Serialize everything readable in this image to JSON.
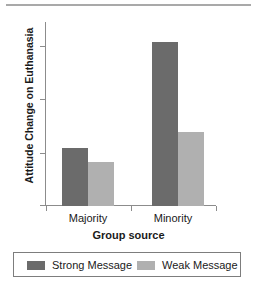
{
  "chart_data": {
    "type": "bar",
    "title": "",
    "xlabel": "Group source",
    "ylabel": "Attitude Change on Euthanasia",
    "categories": [
      "Majority",
      "Minority"
    ],
    "series": [
      {
        "name": "Strong Message",
        "values": [
          4.08,
          6.07
        ],
        "color": "#6b6b6b"
      },
      {
        "name": "Weak Message",
        "values": [
          3.83,
          4.38
        ],
        "color": "#b0b0b0"
      }
    ],
    "ylim": [
      3,
      6.45
    ],
    "yticks": [
      3,
      4,
      5,
      6
    ],
    "ytick_labels": [
      "3",
      "4",
      "5",
      "6"
    ],
    "grid": false,
    "legend_position": "bottom"
  },
  "axes": {
    "y_title": "Attitude Change on Euthanasia",
    "x_title": "Group source",
    "y_tick_labels": [
      "6",
      "5",
      "4",
      "3"
    ],
    "x_tick_labels": [
      "Majority",
      "Minority"
    ]
  },
  "legend": {
    "items": [
      {
        "label": "Strong Message",
        "color": "#6b6b6b"
      },
      {
        "label": "Weak Message",
        "color": "#b0b0b0"
      }
    ]
  }
}
